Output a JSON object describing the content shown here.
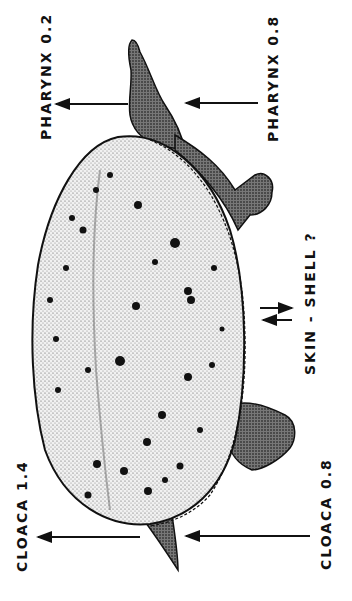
{
  "figure": {
    "colors": {
      "ink": "#111111",
      "shell_fill": "#e9e9e9",
      "background": "#ffffff"
    }
  },
  "labels": {
    "pharynx_left": "PHARYNX 0.2",
    "pharynx_right": "PHARYNX 0.8",
    "skin_shell": "SKIN - SHELL ?",
    "cloaca_left": "CLOACA 1.4",
    "cloaca_right": "CLOACA 0.8"
  },
  "arrows": [
    {
      "name": "pharynx-out",
      "direction": "left",
      "y": 104
    },
    {
      "name": "pharynx-in",
      "direction": "left",
      "y": 103
    },
    {
      "name": "skin-shell-out",
      "direction": "right",
      "y": 308
    },
    {
      "name": "skin-shell-in",
      "direction": "left",
      "y": 320
    },
    {
      "name": "cloaca-out",
      "direction": "left",
      "y": 537
    },
    {
      "name": "cloaca-in",
      "direction": "left",
      "y": 536
    }
  ]
}
